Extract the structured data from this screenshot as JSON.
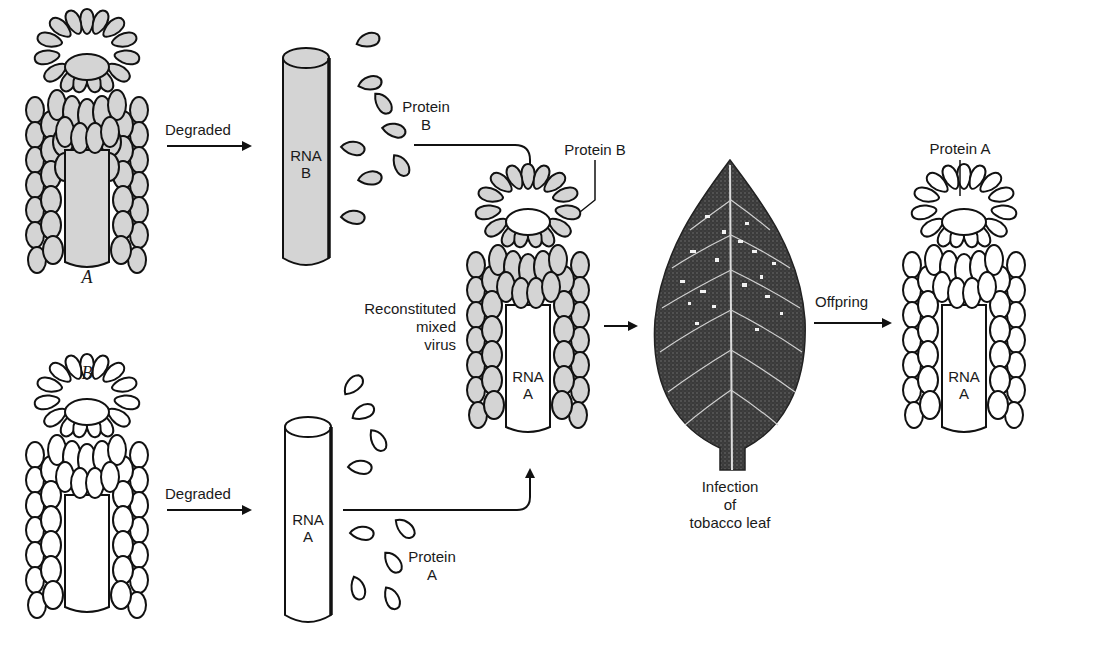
{
  "diagram": {
    "title": "",
    "colors": {
      "protein_a_fill": "#ffffff",
      "protein_b_fill": "#d4d4d4",
      "stroke": "#111111",
      "leaf_dark": "#2a2a2a"
    },
    "viruses": [
      {
        "id": "virus-a",
        "label": "A",
        "coat": "Protein A? no – gray coat (B-like)",
        "rna": ""
      },
      {
        "id": "virus-b",
        "label": "B",
        "coat": "white",
        "rna": ""
      }
    ],
    "labels": {
      "virus_a": "A",
      "virus_b": "B",
      "degraded_top": "Degraded",
      "degraded_bottom": "Degraded",
      "rna_b": "RNA\nB",
      "rna_a": "RNA\nA",
      "protein_b_free": "Protein\nB",
      "protein_a_free": "Protein\nA",
      "protein_b_callout": "Protein B",
      "reconstituted": "Reconstituted\nmixed\nvirus",
      "rna_mixed": "RNA\nA",
      "infection": "Infection\nof\ntobacco leaf",
      "offspring": "Offpring",
      "protein_a_callout": "Protein A",
      "rna_offspring": "RNA\nA"
    },
    "flow": [
      {
        "from": "virus-a",
        "to": "rna-b + protein-b",
        "label": "Degraded"
      },
      {
        "from": "virus-b",
        "to": "rna-a + protein-a",
        "label": "Degraded"
      },
      {
        "from": "protein-b",
        "to": "reconstituted-mixed-virus",
        "label": ""
      },
      {
        "from": "rna-a",
        "to": "reconstituted-mixed-virus",
        "label": ""
      },
      {
        "from": "reconstituted-mixed-virus",
        "to": "tobacco-leaf",
        "label": ""
      },
      {
        "from": "tobacco-leaf",
        "to": "offspring-virus",
        "label": "Offpring"
      }
    ]
  }
}
